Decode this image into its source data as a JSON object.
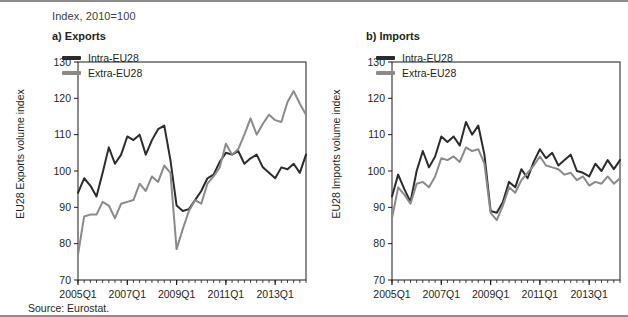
{
  "figure": {
    "index_note": "Index, 2010=100",
    "source": "Source:  Eurostat.",
    "colors": {
      "intra": "#2b2b2b",
      "extra": "#8a8a8a",
      "axis": "#1a1a1a",
      "rule": "#8c8c8c"
    }
  },
  "panels": [
    {
      "key": "exports",
      "title": "a) Exports",
      "ylabel": "EU28 Exports volume index",
      "legend": [
        {
          "label": "Intra-EU28",
          "color": "#2b2b2b"
        },
        {
          "label": "Extra-EU28",
          "color": "#8a8a8a"
        }
      ]
    },
    {
      "key": "imports",
      "title": "b) Imports",
      "ylabel": "EU28 Imports volume index",
      "legend": [
        {
          "label": "Intra-EU28",
          "color": "#2b2b2b"
        },
        {
          "label": "Extra-EU28",
          "color": "#8a8a8a"
        }
      ]
    }
  ],
  "chart_data": [
    {
      "type": "line",
      "panel": "a",
      "title": "a) Exports",
      "subtitle": "Index, 2010=100",
      "xlabel": "",
      "ylabel": "EU28 Exports volume index",
      "ylim": [
        70,
        130
      ],
      "yticks": [
        70,
        80,
        90,
        100,
        110,
        120,
        130
      ],
      "xtick_labels": [
        "2005Q1",
        "2007Q1",
        "2009Q1",
        "2011Q1",
        "2013Q1"
      ],
      "xtick_index": [
        0,
        8,
        16,
        24,
        32
      ],
      "grid": false,
      "legend_position": "top-left",
      "x": [
        "2005Q1",
        "2005Q2",
        "2005Q3",
        "2005Q4",
        "2006Q1",
        "2006Q2",
        "2006Q3",
        "2006Q4",
        "2007Q1",
        "2007Q2",
        "2007Q3",
        "2007Q4",
        "2008Q1",
        "2008Q2",
        "2008Q3",
        "2008Q4",
        "2009Q1",
        "2009Q2",
        "2009Q3",
        "2009Q4",
        "2010Q1",
        "2010Q2",
        "2010Q3",
        "2010Q4",
        "2011Q1",
        "2011Q2",
        "2011Q3",
        "2011Q4",
        "2012Q1",
        "2012Q2",
        "2012Q3",
        "2012Q4",
        "2013Q1",
        "2013Q2",
        "2013Q3",
        "2013Q4",
        "2014Q1",
        "2014Q2"
      ],
      "series": [
        {
          "name": "Intra-EU28",
          "color": "#2b2b2b",
          "values": [
            94.0,
            98.0,
            96.0,
            93.0,
            99.5,
            106.5,
            102.0,
            104.5,
            109.5,
            108.5,
            110.0,
            104.5,
            108.5,
            111.5,
            112.5,
            103.0,
            90.5,
            89.0,
            89.5,
            92.0,
            94.5,
            98.0,
            99.0,
            102.5,
            105.0,
            104.5,
            105.5,
            102.0,
            103.5,
            104.5,
            101.0,
            99.5,
            98.0,
            101.0,
            100.5,
            102.0,
            99.5,
            104.5
          ]
        },
        {
          "name": "Extra-EU28",
          "color": "#8a8a8a",
          "values": [
            77.0,
            87.5,
            88.0,
            88.0,
            91.5,
            90.5,
            87.0,
            91.0,
            91.5,
            92.0,
            96.5,
            94.5,
            98.5,
            97.0,
            101.5,
            99.5,
            78.5,
            84.0,
            89.0,
            92.0,
            91.0,
            96.5,
            98.5,
            101.0,
            107.5,
            104.5,
            106.0,
            110.0,
            114.5,
            110.0,
            113.0,
            115.5,
            114.0,
            113.5,
            119.0,
            122.0,
            118.5,
            115.5
          ]
        }
      ]
    },
    {
      "type": "line",
      "panel": "b",
      "title": "b) Imports",
      "subtitle": "Index, 2010=100",
      "xlabel": "",
      "ylabel": "EU28 Imports volume index",
      "ylim": [
        70,
        130
      ],
      "yticks": [
        70,
        80,
        90,
        100,
        110,
        120,
        130
      ],
      "xtick_labels": [
        "2005Q1",
        "2007Q1",
        "2009Q1",
        "2011Q1",
        "2013Q1"
      ],
      "xtick_index": [
        0,
        8,
        16,
        24,
        32
      ],
      "grid": false,
      "legend_position": "top-left",
      "x": [
        "2005Q1",
        "2005Q2",
        "2005Q3",
        "2005Q4",
        "2006Q1",
        "2006Q2",
        "2006Q3",
        "2006Q4",
        "2007Q1",
        "2007Q2",
        "2007Q3",
        "2007Q4",
        "2008Q1",
        "2008Q2",
        "2008Q3",
        "2008Q4",
        "2009Q1",
        "2009Q2",
        "2009Q3",
        "2009Q4",
        "2010Q1",
        "2010Q2",
        "2010Q3",
        "2010Q4",
        "2011Q1",
        "2011Q2",
        "2011Q3",
        "2011Q4",
        "2012Q1",
        "2012Q2",
        "2012Q3",
        "2012Q4",
        "2013Q1",
        "2013Q2",
        "2013Q3",
        "2013Q4",
        "2014Q1",
        "2014Q2"
      ],
      "series": [
        {
          "name": "Intra-EU28",
          "color": "#2b2b2b",
          "values": [
            93.0,
            99.0,
            95.0,
            91.5,
            100.0,
            105.5,
            101.0,
            104.0,
            109.5,
            108.0,
            109.5,
            107.0,
            113.5,
            110.0,
            112.5,
            104.5,
            89.0,
            88.5,
            91.5,
            97.0,
            95.5,
            100.5,
            98.0,
            102.5,
            106.0,
            103.5,
            105.0,
            101.5,
            103.0,
            104.5,
            100.0,
            99.5,
            98.5,
            102.0,
            100.0,
            103.0,
            100.5,
            103.0
          ]
        },
        {
          "name": "Extra-EU28",
          "color": "#8a8a8a",
          "values": [
            87.0,
            95.5,
            93.5,
            91.0,
            96.5,
            97.0,
            95.5,
            98.5,
            103.5,
            103.0,
            104.0,
            102.5,
            106.5,
            105.5,
            106.0,
            102.0,
            88.5,
            86.5,
            90.5,
            95.5,
            94.0,
            97.5,
            99.5,
            101.5,
            104.0,
            101.5,
            101.0,
            100.5,
            99.0,
            99.5,
            97.5,
            98.5,
            96.0,
            97.0,
            96.5,
            98.5,
            96.5,
            98.0
          ]
        }
      ]
    }
  ]
}
